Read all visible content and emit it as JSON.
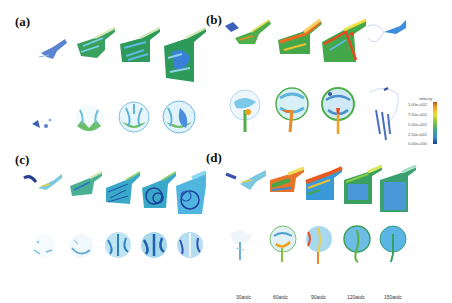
{
  "figure": {
    "panels": [
      {
        "id": "a",
        "label": "(a)",
        "columns": 4
      },
      {
        "id": "b",
        "label": "(b)",
        "columns": 4
      },
      {
        "id": "c",
        "label": "(c)",
        "columns": 5
      },
      {
        "id": "d",
        "label": "(d)",
        "columns": 5
      }
    ],
    "time_labels": [
      "30atdc",
      "60atdc",
      "90atdc",
      "120atdc",
      "150atdc"
    ],
    "legend": {
      "title": "velocity",
      "ticks": [
        "1.00e+002",
        "7.50e+001",
        "5.00e+001",
        "2.50e+001",
        "0.00e+000"
      ],
      "colors": [
        "#b0561c",
        "#f0a020",
        "#e8e030",
        "#7cc040",
        "#3aa88a",
        "#3a8ed0",
        "#1a3c8a"
      ]
    }
  }
}
